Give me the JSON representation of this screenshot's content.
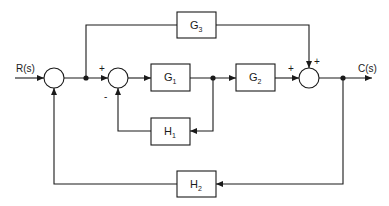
{
  "diagram": {
    "type": "block-diagram",
    "signals": {
      "input": "R(s)",
      "output": "C(s)"
    },
    "blocks": [
      {
        "id": "G1",
        "base": "G",
        "sub": "1"
      },
      {
        "id": "G2",
        "base": "G",
        "sub": "2"
      },
      {
        "id": "G3",
        "base": "G",
        "sub": "3"
      },
      {
        "id": "H1",
        "base": "H",
        "sub": "1"
      },
      {
        "id": "H2",
        "base": "H",
        "sub": "2"
      }
    ],
    "summing_junctions": [
      {
        "id": "S1",
        "signs": []
      },
      {
        "id": "S2",
        "signs": [
          "+",
          "-"
        ]
      },
      {
        "id": "S3",
        "signs": [
          "+",
          "+"
        ]
      }
    ],
    "connections": [
      "R(s) -> S1",
      "S1 -> S2 (+)",
      "S1 -> G3 (feedforward)",
      "S2 -> G1",
      "G1 -> G2",
      "G1 -> H1 -> S2 (-)",
      "G2 -> S3 (+)",
      "G3 -> S3 (+)",
      "S3 -> C(s)",
      "C(s) -> H2 -> S1"
    ]
  }
}
